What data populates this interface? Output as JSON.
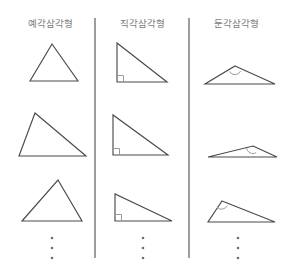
{
  "figure": {
    "title_visible": false,
    "width": 285,
    "height": 275,
    "background_color": "#ffffff",
    "stroke_color": "#4a4a4a",
    "marker_color": "#9a9a9a",
    "divider_color": "#5d5d5d",
    "label_color": "#7b7b7b"
  },
  "columns": [
    {
      "id": "acute",
      "title": "예각삼각형",
      "angle_marker": "none",
      "triangles": [
        {
          "name": "acute-triangle-1",
          "points": "52,44 78,81 30,81"
        },
        {
          "name": "acute-triangle-2",
          "points": "35,113 86,156 19,156"
        },
        {
          "name": "acute-triangle-3",
          "points": "58,180 82,221 22,221"
        }
      ],
      "ellipsis_dots": 3
    },
    {
      "id": "right",
      "title": "직각삼각형",
      "angle_marker": "right-angle-square",
      "triangles": [
        {
          "name": "right-triangle-1",
          "points": "117,43 117,82 167,82",
          "marker": "M 117,75.5 L 123.5,75.5 L 123.5,82"
        },
        {
          "name": "right-triangle-2",
          "points": "113,115 113,155 168,155",
          "marker": "M 113,148.5 L 119.5,148.5 L 119.5,155"
        },
        {
          "name": "right-triangle-3",
          "points": "115,194 115,221 172,221",
          "marker": "M 115,214.5 L 121.5,214.5 L 121.5,221"
        }
      ],
      "ellipsis_dots": 3
    },
    {
      "id": "obtuse",
      "title": "둔각삼각형",
      "angle_marker": "obtuse-angle-arc",
      "triangles": [
        {
          "name": "obtuse-triangle-1",
          "points": "235,66 275,84 205,84",
          "marker": "M 229.5,71.5 A 6.2,6.2 0 0 0 240.6,71.0"
        },
        {
          "name": "obtuse-triangle-2",
          "points": "253,146 277,157 208,157",
          "marker": "M 246.6,148.0 A 6.4,6.4 0 0 0 256.2,152.6"
        },
        {
          "name": "obtuse-triangle-3",
          "points": "222,201 275,222 208,222",
          "marker": "M 217.0,207.5 A 6.6,6.6 0 0 0 227.3,205.6"
        }
      ],
      "ellipsis_dots": 3
    }
  ],
  "dividers": [
    {
      "name": "divider-1",
      "x": 95,
      "y1": 18,
      "y2": 258
    },
    {
      "name": "divider-2",
      "x": 189,
      "y1": 18,
      "y2": 258
    }
  ],
  "ellipses": [
    {
      "name": "ellipsis-acute",
      "cx": 52,
      "cy": [
        238,
        248,
        258
      ]
    },
    {
      "name": "ellipsis-right",
      "cx": 143,
      "cy": [
        238,
        248,
        258
      ]
    },
    {
      "name": "ellipsis-obtuse",
      "cx": 238,
      "cy": [
        238,
        248,
        258
      ]
    }
  ]
}
